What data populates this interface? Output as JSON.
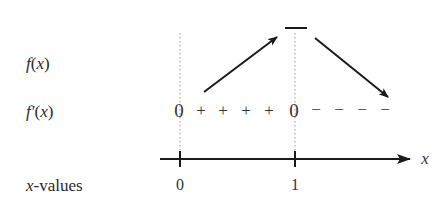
{
  "rows": {
    "f": {
      "name": "f",
      "arg": "x",
      "label": "f(x)"
    },
    "fprime": {
      "name": "f′",
      "arg": "x",
      "label": "f′(x)"
    },
    "xvalues": {
      "var": "x",
      "suffix": "-values",
      "label": "x-values"
    }
  },
  "sign_chart": {
    "zero_left": "0",
    "plus_signs": [
      "+",
      "+",
      "+",
      "+"
    ],
    "zero_right": "0",
    "minus_signs": [
      "−",
      "−",
      "−",
      "−"
    ]
  },
  "axis": {
    "variable": "x",
    "ticks": [
      {
        "value": "0"
      },
      {
        "value": "1"
      }
    ]
  },
  "behavior": {
    "left_interval": "increasing",
    "critical_point": "local maximum at x = 1",
    "right_interval": "decreasing"
  },
  "colors": {
    "ink": "#1a1a1a",
    "text": "#333333",
    "dotted": "#9a9a9a"
  }
}
